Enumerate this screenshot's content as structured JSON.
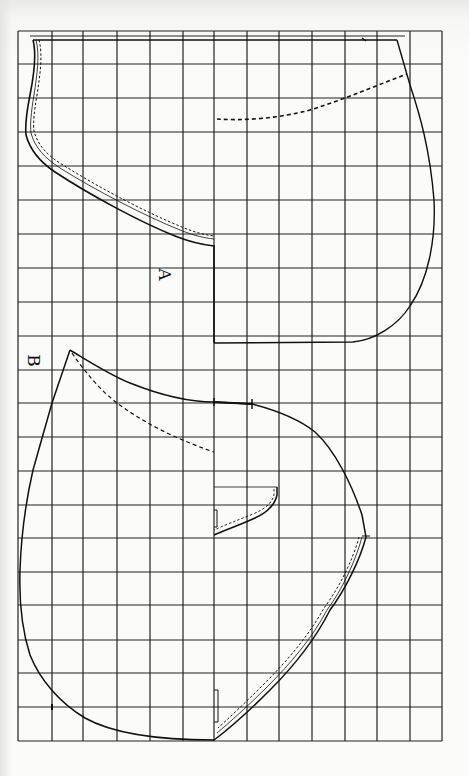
{
  "diagram": {
    "type": "sewing-pattern-on-grid",
    "colors": {
      "background": "#fbfbfa",
      "grid": "#222222",
      "line": "#111111"
    },
    "grid": {
      "x_lines": [
        18,
        52,
        83,
        117,
        150,
        183,
        214,
        247,
        279,
        312,
        345,
        377,
        410,
        442
      ],
      "y_lines": [
        31,
        64,
        98,
        132,
        166,
        200,
        234,
        268,
        302,
        336,
        370,
        403,
        437,
        471,
        505,
        538,
        572,
        605,
        640,
        673,
        707,
        741
      ],
      "columns": 13,
      "rows": 21
    },
    "pieces": [
      {
        "id": "A",
        "label": "А"
      },
      {
        "id": "B",
        "label": "В"
      }
    ]
  }
}
